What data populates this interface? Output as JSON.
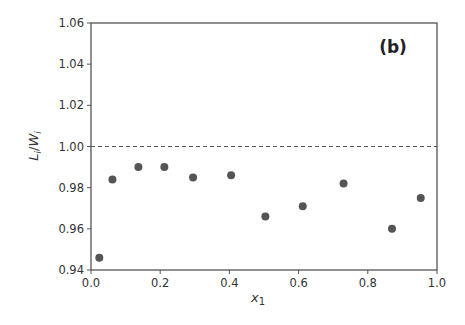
{
  "chart_data": {
    "type": "scatter",
    "title": "",
    "panel_label": "(b)",
    "xlabel": "x1",
    "xlabel_main": "x",
    "xlabel_sub": "1",
    "ylabel": "Li/Wi",
    "ylabel_parts": {
      "L": "L",
      "sub1": "i",
      "slash": "/",
      "W": "W",
      "sub2": "i"
    },
    "xlim": [
      0.0,
      1.0
    ],
    "ylim": [
      0.94,
      1.06
    ],
    "xticks": [
      0.0,
      0.2,
      0.4,
      0.6,
      0.8,
      1.0
    ],
    "xtick_labels": [
      "0.0",
      "0.2",
      "0.4",
      "0.6",
      "0.8",
      "1.0"
    ],
    "yticks": [
      0.94,
      0.96,
      0.98,
      1.0,
      1.02,
      1.04,
      1.06
    ],
    "ytick_labels": [
      "0.94",
      "0.96",
      "0.98",
      "1.00",
      "1.02",
      "1.04",
      "1.06"
    ],
    "grid": false,
    "legend": null,
    "reference_line": {
      "y": 1.0,
      "style": "dashed",
      "color": "#555555"
    },
    "marker_color": "#555555",
    "series": [
      {
        "name": "data",
        "x": [
          0.024,
          0.062,
          0.137,
          0.212,
          0.295,
          0.405,
          0.504,
          0.612,
          0.73,
          0.87,
          0.953
        ],
        "y": [
          0.946,
          0.984,
          0.99,
          0.99,
          0.985,
          0.986,
          0.966,
          0.971,
          0.982,
          0.96,
          0.975
        ]
      }
    ]
  }
}
